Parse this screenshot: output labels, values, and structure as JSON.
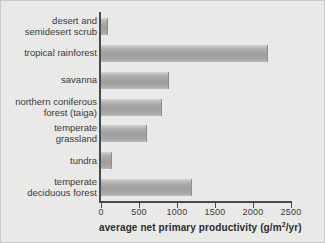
{
  "chart_data": {
    "type": "bar",
    "orientation": "horizontal",
    "title": "",
    "xlabel": "average net primary productivity (g/m²/yr)",
    "ylabel": "",
    "xlim": [
      0,
      2500
    ],
    "xticks": [
      0,
      500,
      1000,
      1500,
      2000,
      2500
    ],
    "xtick_labels": [
      "0",
      "500",
      "1000",
      "1500",
      "2000",
      "2500"
    ],
    "grid": false,
    "legend": false,
    "categories": [
      "desert and\nsemidesert scrub",
      "tropical rainforest",
      "savanna",
      "northern coniferous\nforest (taiga)",
      "temperate\ngrassland",
      "tundra",
      "temperate\ndeciduous forest"
    ],
    "values": [
      90,
      2200,
      900,
      800,
      600,
      140,
      1200
    ],
    "bar_color": "#a8a8a6",
    "axis_color": "#4a4a4a",
    "background_color": "#e9e9e7"
  },
  "axis": {
    "title_main": "average net primary productivity (g/m",
    "title_sup": "2",
    "title_tail": "/yr)"
  }
}
